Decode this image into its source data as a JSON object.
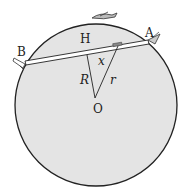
{
  "diagram": {
    "labels": {
      "A": "A",
      "B": "B",
      "H": "H",
      "O": "O",
      "R": "R",
      "r": "r",
      "x": "x"
    },
    "colors": {
      "planet_fill": "#e4e4e4",
      "stroke": "#222222",
      "tunnel_fill": "#ffffff",
      "car_fill": "#888888"
    }
  }
}
